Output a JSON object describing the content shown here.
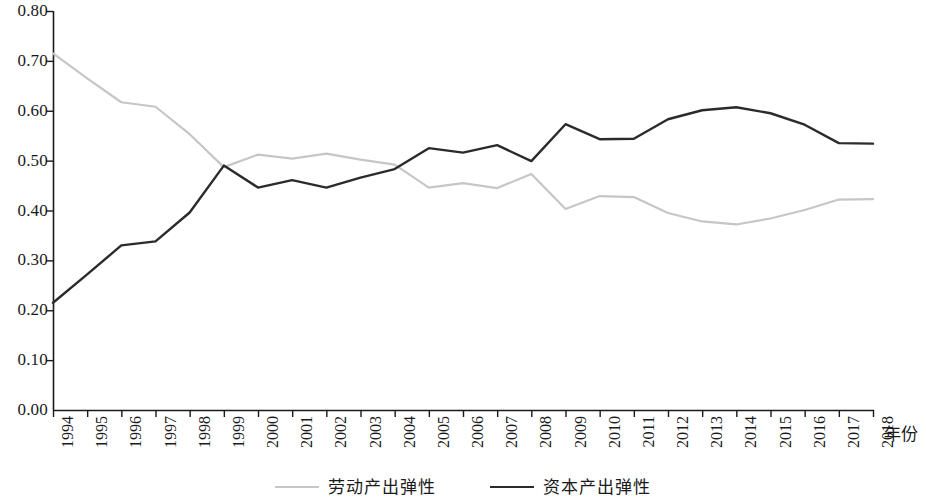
{
  "chart_data": {
    "type": "line",
    "title": "",
    "xlabel": "年份",
    "ylabel": "",
    "xlim": [
      1994,
      2018
    ],
    "ylim": [
      0.0,
      0.8
    ],
    "grid": false,
    "legend_position": "bottom-center",
    "x": [
      1994,
      1995,
      1996,
      1997,
      1998,
      1999,
      2000,
      2001,
      2002,
      2003,
      2004,
      2005,
      2006,
      2007,
      2008,
      2009,
      2010,
      2011,
      2012,
      2013,
      2014,
      2015,
      2016,
      2017,
      2018
    ],
    "categories": [
      "1994",
      "1995",
      "1996",
      "1997",
      "1998",
      "1999",
      "2000",
      "2001",
      "2002",
      "2003",
      "2004",
      "2005",
      "2006",
      "2007",
      "2008",
      "2009",
      "2010",
      "2011",
      "2012",
      "2013",
      "2014",
      "2015",
      "2016",
      "2017",
      "2018"
    ],
    "series": [
      {
        "name": "劳动产出弹性",
        "color": "#c6c6c6",
        "values": [
          0.715,
          0.665,
          0.617,
          0.608,
          0.553,
          0.487,
          0.512,
          0.504,
          0.514,
          0.502,
          0.492,
          0.446,
          0.455,
          0.445,
          0.473,
          0.403,
          0.429,
          0.427,
          0.395,
          0.378,
          0.372,
          0.384,
          0.401,
          0.422,
          0.423
        ]
      },
      {
        "name": "资本产出弹性",
        "color": "#2b2b2b",
        "values": [
          0.215,
          0.272,
          0.33,
          0.338,
          0.396,
          0.49,
          0.446,
          0.461,
          0.446,
          0.466,
          0.483,
          0.525,
          0.516,
          0.531,
          0.499,
          0.573,
          0.543,
          0.544,
          0.583,
          0.601,
          0.607,
          0.595,
          0.572,
          0.535,
          0.534
        ]
      }
    ],
    "ytick_labels": [
      "0.80",
      "0.70",
      "0.60",
      "0.50",
      "0.40",
      "0.30",
      "0.20",
      "0.10",
      "0.00"
    ],
    "ytick_values": [
      0.8,
      0.7,
      0.6,
      0.5,
      0.4,
      0.3,
      0.2,
      0.1,
      0.0
    ]
  },
  "legend": {
    "entries": [
      {
        "label": "劳动产出弹性"
      },
      {
        "label": "资本产出弹性"
      }
    ]
  },
  "axis": {
    "x_title": "年份"
  },
  "colors": {
    "labor_line": "#c6c6c6",
    "capital_line": "#2b2b2b",
    "axis": "#1a1a1a"
  }
}
